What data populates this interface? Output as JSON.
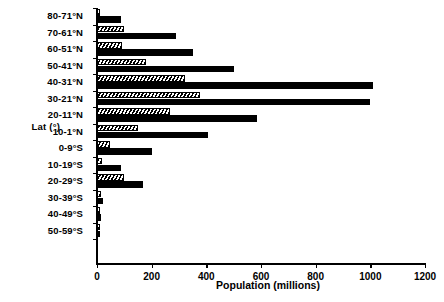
{
  "chart_data": {
    "type": "bar",
    "orientation": "horizontal",
    "title": "",
    "xlabel": "Population (millions)",
    "ylabel": "Lat (°)",
    "xlim": [
      0,
      1200
    ],
    "xticks": [
      0,
      200,
      400,
      600,
      800,
      1000,
      1200
    ],
    "xtick_labels": [
      "0",
      "200",
      "400",
      "600",
      "800",
      "1000",
      "1200"
    ],
    "grid": false,
    "legend": false,
    "categories": [
      "80-71°N",
      "70-61°N",
      "60-51°N",
      "50-41°N",
      "40-31°N",
      "30-21°N",
      "20-11°N",
      "10-1°N",
      "0-9°S",
      "10-19°S",
      "20-29°S",
      "30-39°S",
      "40-49°S",
      "50-59°S"
    ],
    "series": [
      {
        "name": "hatched",
        "pattern": "diagonal-hatch",
        "values": [
          10,
          100,
          92,
          180,
          322,
          377,
          267,
          150,
          48,
          18,
          98,
          14,
          10,
          2
        ]
      },
      {
        "name": "solid",
        "pattern": "solid-black",
        "values": [
          88,
          289,
          351,
          501,
          1010,
          999,
          585,
          406,
          200,
          88,
          168,
          22,
          14,
          3
        ]
      }
    ]
  }
}
